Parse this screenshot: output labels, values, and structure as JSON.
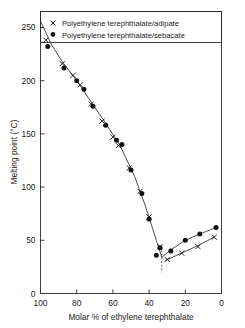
{
  "chart_data": {
    "type": "line",
    "title": "",
    "xlabel": "Molar % of ethylene terephthalate",
    "ylabel": "Melting point (°C)",
    "xlim": [
      100,
      0
    ],
    "ylim": [
      0,
      265
    ],
    "x_reversed": true,
    "grid": false,
    "xticks": [
      100,
      80,
      60,
      40,
      20,
      0
    ],
    "xticklabels": [
      "100",
      "80",
      "60",
      "40",
      "20",
      "0"
    ],
    "yticks": [
      0,
      50,
      100,
      150,
      200,
      250
    ],
    "yticklabels": [
      "0",
      "50",
      "100",
      "150",
      "200",
      "250"
    ],
    "legend_position": "top",
    "legend": [
      {
        "marker": "cross",
        "label": "Polyethylene terephthalate/adipate"
      },
      {
        "marker": "dot",
        "label": "Polyethylene terephthalate/sebacate"
      }
    ],
    "series": [
      {
        "name": "Polyethylene terephthalate/adipate",
        "marker": "cross",
        "points": [
          {
            "x": 97,
            "y": 238
          },
          {
            "x": 88,
            "y": 216
          },
          {
            "x": 82,
            "y": 205
          },
          {
            "x": 78,
            "y": 196
          },
          {
            "x": 72,
            "y": 178
          },
          {
            "x": 66,
            "y": 162
          },
          {
            "x": 60,
            "y": 147
          },
          {
            "x": 57,
            "y": 139
          },
          {
            "x": 51,
            "y": 118
          },
          {
            "x": 45,
            "y": 96
          },
          {
            "x": 40,
            "y": 72
          },
          {
            "x": 34,
            "y": 44
          },
          {
            "x": 30,
            "y": 32
          },
          {
            "x": 22,
            "y": 38
          },
          {
            "x": 13,
            "y": 44
          },
          {
            "x": 4,
            "y": 53
          }
        ]
      },
      {
        "name": "Polyethylene terephthalate/sebacate",
        "marker": "dot",
        "points": [
          {
            "x": 96,
            "y": 232
          },
          {
            "x": 87,
            "y": 212
          },
          {
            "x": 80,
            "y": 200
          },
          {
            "x": 76,
            "y": 192
          },
          {
            "x": 71,
            "y": 176
          },
          {
            "x": 64,
            "y": 158
          },
          {
            "x": 58,
            "y": 144
          },
          {
            "x": 55,
            "y": 140
          },
          {
            "x": 50,
            "y": 116
          },
          {
            "x": 44,
            "y": 94
          },
          {
            "x": 40,
            "y": 70
          },
          {
            "x": 34,
            "y": 43
          },
          {
            "x": 36,
            "y": 36
          },
          {
            "x": 28,
            "y": 40
          },
          {
            "x": 20,
            "y": 50
          },
          {
            "x": 12,
            "y": 56
          },
          {
            "x": 3,
            "y": 62
          }
        ]
      }
    ],
    "liquidus_curve": [
      {
        "x": 100,
        "y": 256
      },
      {
        "x": 94,
        "y": 234
      },
      {
        "x": 88,
        "y": 218
      },
      {
        "x": 80,
        "y": 200
      },
      {
        "x": 72,
        "y": 180
      },
      {
        "x": 64,
        "y": 160
      },
      {
        "x": 56,
        "y": 139
      },
      {
        "x": 48,
        "y": 110
      },
      {
        "x": 42,
        "y": 82
      },
      {
        "x": 36,
        "y": 50
      },
      {
        "x": 33,
        "y": 34
      }
    ],
    "sebacate_branch": [
      {
        "x": 33,
        "y": 34
      },
      {
        "x": 28,
        "y": 41
      },
      {
        "x": 20,
        "y": 50
      },
      {
        "x": 12,
        "y": 56
      },
      {
        "x": 3,
        "y": 62
      }
    ],
    "adipate_branch": [
      {
        "x": 31,
        "y": 31
      },
      {
        "x": 22,
        "y": 38
      },
      {
        "x": 13,
        "y": 45
      },
      {
        "x": 4,
        "y": 53
      }
    ],
    "eutectic_marker": {
      "x": 33,
      "y_top": 44,
      "y_bottom": 20
    }
  }
}
